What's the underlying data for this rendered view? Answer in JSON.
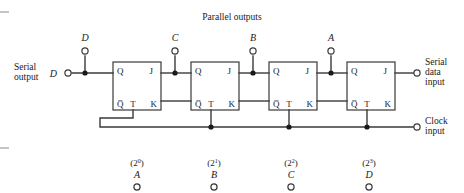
{
  "figure": {
    "title": "Parallel outputs",
    "serial_output_label_line1": "Serial",
    "serial_output_label_line2": "output",
    "serial_output_pin": "D",
    "serial_input_label_line1": "Serial",
    "serial_input_label_line2": "data",
    "serial_input_label_line3": "input",
    "clock_label_line1": "Clock",
    "clock_label_line2": "input"
  },
  "pins": {
    "q": "Q",
    "qbar": "Q̅",
    "j": "J",
    "k": "K",
    "t": "T"
  },
  "stages": [
    {
      "top_terminal": "D",
      "bottom_weight_base": "(2",
      "bottom_weight_exp": "0",
      "bottom_weight_close": ")",
      "bottom_label": "A"
    },
    {
      "top_terminal": "C",
      "bottom_weight_base": "(2",
      "bottom_weight_exp": "1",
      "bottom_weight_close": ")",
      "bottom_label": "B"
    },
    {
      "top_terminal": "B",
      "bottom_weight_base": "(2",
      "bottom_weight_exp": "2",
      "bottom_weight_close": ")",
      "bottom_label": "C"
    },
    {
      "top_terminal": "A",
      "bottom_weight_base": "(2",
      "bottom_weight_exp": "3",
      "bottom_weight_close": ")",
      "bottom_label": "D"
    }
  ],
  "colors": {
    "wire": "#3a3a3a",
    "text": "#1a1a1a",
    "background": "#ffffff"
  }
}
